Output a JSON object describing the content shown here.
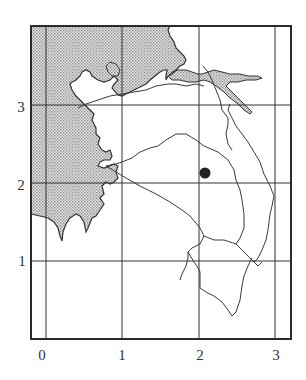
{
  "map": {
    "frame": {
      "x0": 31,
      "y0": 26,
      "x1": 291,
      "y1": 339
    },
    "colors": {
      "frame": "#2b2b2b",
      "grid": "#333333",
      "land_shaded": "#c9c9c9",
      "coast": "#333333",
      "river": "#3a3a3a",
      "marker": "#222222",
      "background": "#ffffff"
    },
    "x_ticks": [
      {
        "label": "0",
        "px": 46
      },
      {
        "label": "1",
        "px": 122
      },
      {
        "label": "2",
        "px": 199
      },
      {
        "label": "3",
        "px": 275
      }
    ],
    "y_ticks": [
      {
        "label": "1",
        "px": 261
      },
      {
        "label": "2",
        "px": 183
      },
      {
        "label": "3",
        "px": 105
      }
    ],
    "marker": {
      "shape": "filled-circle",
      "cx": 205,
      "cy": 173,
      "r": 5.5,
      "grid_x": 2.08,
      "grid_y": 2.13
    }
  },
  "labels": {
    "x0": "0",
    "x1": "1",
    "x2": "2",
    "x3": "3",
    "y1": "1",
    "y2": "2",
    "y3": "3"
  }
}
